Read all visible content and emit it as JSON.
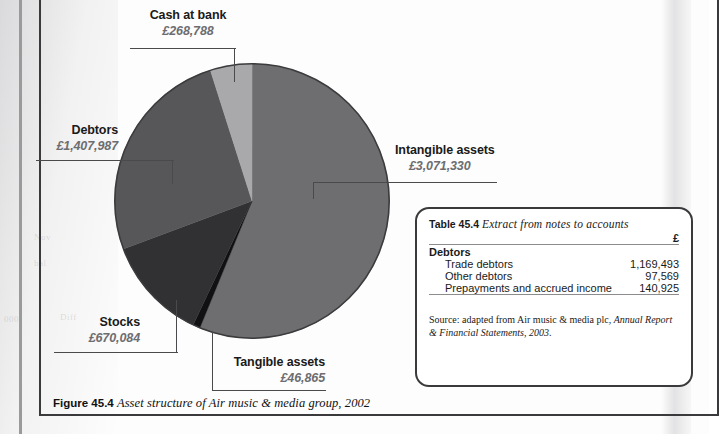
{
  "figure": {
    "number": "Figure 45.4",
    "caption": "Asset structure of Air music & media group, 2002"
  },
  "chart_data": {
    "type": "pie",
    "title": "Asset structure of Air music & media group, 2002",
    "currency": "£",
    "total": 5465054,
    "legend_position": "callout-labels",
    "categories": [
      "Intangible assets",
      "Debtors",
      "Stocks",
      "Cash at bank",
      "Tangible assets"
    ],
    "values": [
      3071330,
      1407987,
      670084,
      268788,
      46865
    ],
    "slices": [
      {
        "label": "Intangible assets",
        "value_text": "£3,071,330",
        "value": 3071330,
        "percent": 56.2,
        "start_angle": 0,
        "sweep": 202.34,
        "color": "#6e6e70"
      },
      {
        "label": "Tangible assets",
        "value_text": "£46,865",
        "value": 46865,
        "percent": 0.86,
        "start_angle": 202.34,
        "sweep": 3.09,
        "color": "#111113"
      },
      {
        "label": "Stocks",
        "value_text": "£670,084",
        "value": 670084,
        "percent": 12.26,
        "start_angle": 205.43,
        "sweep": 44.14,
        "color": "#313133"
      },
      {
        "label": "Debtors",
        "value_text": "£1,407,987",
        "value": 1407987,
        "percent": 25.76,
        "start_angle": 249.57,
        "sweep": 92.76,
        "color": "#57575a"
      },
      {
        "label": "Cash at bank",
        "value_text": "£268,788",
        "value": 268788,
        "percent": 4.92,
        "start_angle": 342.33,
        "sweep": 17.71,
        "color": "#a9a9ab"
      }
    ]
  },
  "callouts": {
    "cash_at_bank": {
      "label": "Cash at bank",
      "value": "£268,788"
    },
    "debtors": {
      "label": "Debtors",
      "value": "£1,407,987"
    },
    "intangible": {
      "label": "Intangible assets",
      "value": "£3,071,330"
    },
    "stocks": {
      "label": "Stocks",
      "value": "£670,084"
    },
    "tangible": {
      "label": "Tangible assets",
      "value": "£46,865"
    }
  },
  "table": {
    "number": "Table 45.4",
    "title": "Extract from notes to accounts",
    "currency_header": "£",
    "group_heading": "Debtors",
    "rows": [
      {
        "name": "Trade debtors",
        "amount": "1,169,493"
      },
      {
        "name": "Other debtors",
        "amount": "97,569"
      },
      {
        "name": "Prepayments and accrued income",
        "amount": "140,925"
      }
    ],
    "source_prefix": "Source: adapted from Air music & media plc,",
    "source_italic": "Annual Report & Financial Statements, 2003",
    "source_suffix": "."
  },
  "ghost": {
    "a": "Nov",
    "b": "bal",
    "c": "000",
    "d": "Diff"
  }
}
